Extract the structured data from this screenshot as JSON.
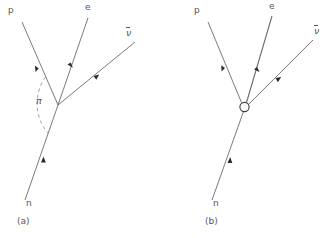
{
  "figure": {
    "stroke_color": "#6b6b70",
    "text_color": "#555558",
    "background_color": "#ffffff",
    "panels": [
      {
        "id": "a",
        "caption": "(a)",
        "vertex_marker": "none",
        "exchange_label": "π",
        "labels": {
          "incoming": "n",
          "outgoing_proton": "p",
          "outgoing_electron": "e",
          "outgoing_antineutrino": "ν",
          "antineutrino_has_overbar": true
        },
        "lines": [
          {
            "name": "proton-line",
            "from_label": "p",
            "arrow": "toward-vertex"
          },
          {
            "name": "electron-line",
            "from_label": "e",
            "arrow": "toward-vertex"
          },
          {
            "name": "antineutrino-line",
            "from_label": "nu-bar",
            "arrow": "toward-vertex"
          },
          {
            "name": "neutron-line",
            "from_label": "n",
            "arrow": "toward-vertex"
          }
        ]
      },
      {
        "id": "b",
        "caption": "(b)",
        "vertex_marker": "open-circle",
        "exchange_label": null,
        "labels": {
          "incoming": "n",
          "outgoing_proton": "p",
          "outgoing_electron": "e",
          "outgoing_antineutrino": "ν",
          "antineutrino_has_overbar": true
        },
        "lines": [
          {
            "name": "proton-line",
            "from_label": "p",
            "arrow": "toward-vertex"
          },
          {
            "name": "electron-line",
            "from_label": "e",
            "arrow": "toward-vertex"
          },
          {
            "name": "antineutrino-line",
            "from_label": "nu-bar",
            "arrow": "toward-vertex"
          },
          {
            "name": "neutron-line",
            "from_label": "n",
            "arrow": "toward-vertex"
          }
        ]
      }
    ]
  }
}
